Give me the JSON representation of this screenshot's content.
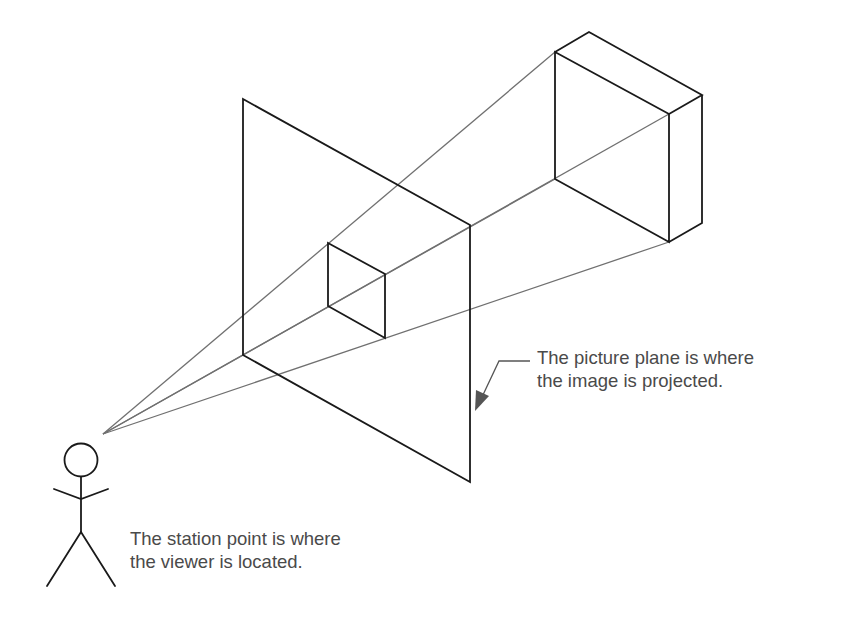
{
  "diagram": {
    "colors": {
      "outline": "#1a1a1a",
      "projection_line": "#707070",
      "text": "#4a4a4a",
      "arrow": "#555555",
      "background": "#ffffff"
    },
    "station_point": [
      103,
      434
    ],
    "large_box": {
      "front": [
        [
          555,
          52
        ],
        [
          669,
          114
        ],
        [
          669,
          242
        ],
        [
          555,
          179
        ]
      ],
      "back_top": [
        589,
        32
      ],
      "back_right_top": [
        702,
        95
      ],
      "back_right_bottom": [
        702,
        223
      ]
    },
    "picture_plane": [
      [
        243,
        99
      ],
      [
        470,
        225
      ],
      [
        470,
        482
      ],
      [
        243,
        355
      ]
    ],
    "projected_square": [
      [
        328,
        243
      ],
      [
        385,
        274
      ],
      [
        385,
        338
      ],
      [
        328,
        306
      ]
    ],
    "projection_lines": [
      {
        "from": [
          103,
          434
        ],
        "to": [
          555,
          52
        ]
      },
      {
        "from": [
          103,
          434
        ],
        "to": [
          669,
          114
        ]
      },
      {
        "from": [
          103,
          434
        ],
        "to": [
          555,
          179
        ]
      },
      {
        "from": [
          103,
          434
        ],
        "to": [
          669,
          242
        ]
      }
    ],
    "labels": {
      "picture_plane": {
        "line1": "The picture plane is where",
        "line2": "the image is projected."
      },
      "station_point": {
        "line1": "The station point is where",
        "line2": "the viewer is located."
      }
    }
  }
}
